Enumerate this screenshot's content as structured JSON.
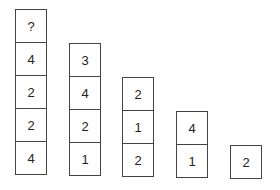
{
  "diagram": {
    "columns": [
      {
        "cells": [
          "?",
          "4",
          "2",
          "2",
          "4"
        ]
      },
      {
        "cells": [
          "3",
          "4",
          "2",
          "1"
        ]
      },
      {
        "cells": [
          "2",
          "1",
          "2"
        ]
      },
      {
        "cells": [
          "4",
          "1"
        ]
      },
      {
        "cells": [
          "2"
        ]
      }
    ]
  }
}
